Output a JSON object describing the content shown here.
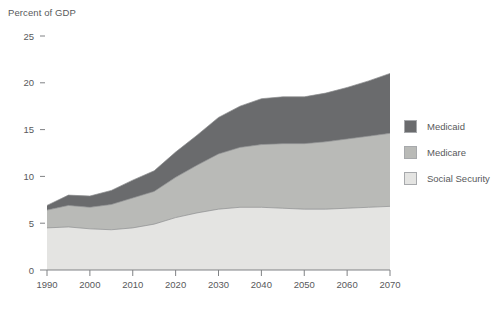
{
  "chart_data": {
    "type": "area",
    "stacked": true,
    "title": "",
    "ylabel": "Percent of GDP",
    "xlabel": "",
    "grid": false,
    "legend_position": "right",
    "xlim": [
      1990,
      2070
    ],
    "ylim": [
      0,
      25
    ],
    "xticks": [
      1990,
      2000,
      2010,
      2020,
      2030,
      2040,
      2050,
      2060,
      2070
    ],
    "yticks": [
      0,
      5,
      10,
      15,
      20,
      25
    ],
    "x": [
      1990,
      1995,
      2000,
      2005,
      2010,
      2015,
      2020,
      2025,
      2030,
      2035,
      2040,
      2045,
      2050,
      2055,
      2060,
      2065,
      2070
    ],
    "series": [
      {
        "name": "Social Security",
        "color": "#e4e4e2",
        "values": [
          4.5,
          4.6,
          4.4,
          4.3,
          4.5,
          4.9,
          5.6,
          6.1,
          6.5,
          6.7,
          6.7,
          6.6,
          6.5,
          6.5,
          6.6,
          6.7,
          6.8
        ]
      },
      {
        "name": "Medicare",
        "color": "#b9bab7",
        "values": [
          1.9,
          2.3,
          2.3,
          2.7,
          3.2,
          3.5,
          4.3,
          5.1,
          5.9,
          6.4,
          6.7,
          6.9,
          7.0,
          7.2,
          7.4,
          7.6,
          7.8
        ]
      },
      {
        "name": "Medicaid",
        "color": "#6a6b6d",
        "values": [
          0.5,
          1.1,
          1.2,
          1.5,
          1.9,
          2.2,
          2.7,
          3.2,
          3.9,
          4.4,
          4.9,
          5.0,
          5.0,
          5.2,
          5.5,
          5.9,
          6.4
        ]
      }
    ],
    "totals": [
      6.9,
      8.0,
      7.9,
      8.5,
      9.6,
      10.6,
      12.6,
      14.4,
      16.3,
      17.5,
      18.3,
      18.5,
      18.5,
      18.9,
      19.5,
      20.2,
      21.0
    ]
  },
  "legend": {
    "items": [
      {
        "label": "Medicaid",
        "color": "#6a6b6d"
      },
      {
        "label": "Medicare",
        "color": "#b9bab7"
      },
      {
        "label": "Social Security",
        "color": "#e4e4e2"
      }
    ]
  },
  "axes": {
    "y_title": "Percent of GDP",
    "y_labels": [
      "25",
      "20",
      "15",
      "10",
      "5",
      "0"
    ],
    "x_labels": [
      "1990",
      "2000",
      "2010",
      "2020",
      "2030",
      "2040",
      "2050",
      "2060",
      "2070"
    ]
  }
}
